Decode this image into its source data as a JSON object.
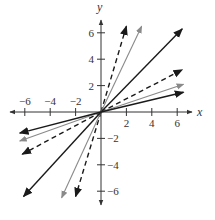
{
  "chart_data": {
    "type": "line",
    "title": "",
    "xlabel": "x",
    "ylabel": "y",
    "xlim": [
      -7,
      7
    ],
    "ylim": [
      -7,
      7
    ],
    "grid": false,
    "legend": null,
    "x_ticks": [
      -6,
      -4,
      -2,
      2,
      4,
      6
    ],
    "y_ticks": [
      6,
      4,
      2,
      -2,
      -4,
      -6
    ],
    "x_tick_labels": [
      "−6",
      "−4",
      "−2",
      "2",
      "4",
      "6"
    ],
    "y_tick_labels": [
      "6",
      "4",
      "2",
      "−2",
      "−4",
      "−6"
    ],
    "series": [
      {
        "name": "steep-dashed-black",
        "style": "dashed",
        "color": "#1a1a1a",
        "vectors": [
          [
            2,
            6.5
          ],
          [
            -2,
            -6.4
          ]
        ]
      },
      {
        "name": "steep-gray",
        "style": "solid",
        "color": "#8a8a8a",
        "vectors": [
          [
            3.2,
            6.5
          ],
          [
            -3.1,
            -6.5
          ]
        ]
      },
      {
        "name": "diagonal-black",
        "style": "solid",
        "color": "#1a1a1a",
        "vectors": [
          [
            6.4,
            6.3
          ],
          [
            -6.1,
            -6.4
          ]
        ]
      },
      {
        "name": "shallow-dashed-black",
        "style": "dashed",
        "color": "#1a1a1a",
        "vectors": [
          [
            6.4,
            3.2
          ],
          [
            -6.2,
            -3.2
          ]
        ]
      },
      {
        "name": "shallow-gray",
        "style": "solid",
        "color": "#8a8a8a",
        "vectors": [
          [
            6.5,
            2.1
          ],
          [
            -6.4,
            -2.2
          ]
        ]
      },
      {
        "name": "flat-black",
        "style": "solid",
        "color": "#1a1a1a",
        "vectors": [
          [
            6.5,
            1.5
          ],
          [
            -6.4,
            -1.6
          ]
        ]
      }
    ],
    "origin_px": [
      101,
      112
    ],
    "px_per_unit": [
      12.7,
      13.2
    ]
  }
}
